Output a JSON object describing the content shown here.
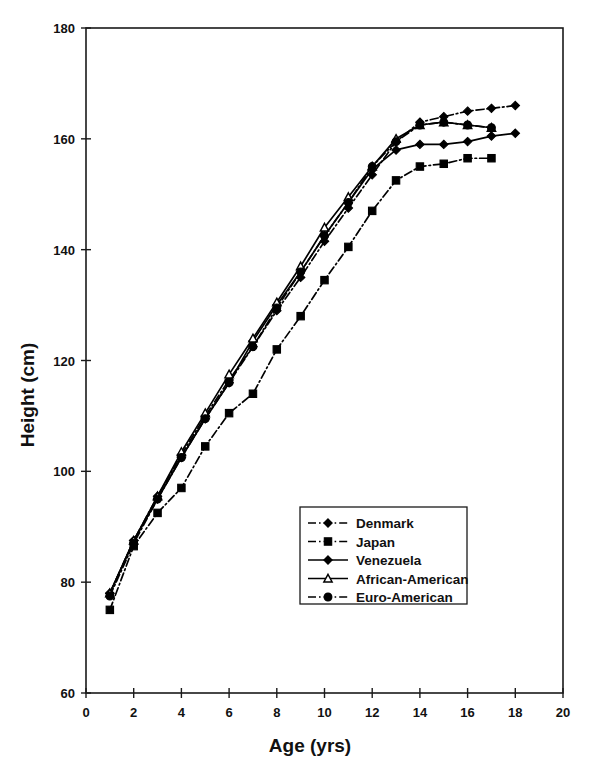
{
  "chart_data": {
    "type": "line",
    "title": "",
    "xlabel": "Age (yrs)",
    "ylabel": "Height (cm)",
    "xlim": [
      0,
      20
    ],
    "ylim": [
      60,
      180
    ],
    "xticks": [
      0,
      2,
      4,
      6,
      8,
      10,
      12,
      14,
      16,
      18,
      20
    ],
    "yticks": [
      60,
      80,
      100,
      120,
      140,
      160,
      180
    ],
    "xtick_labels": [
      "0",
      "2",
      "4",
      "6",
      "8",
      "10",
      "12",
      "14",
      "16",
      "18",
      "20"
    ],
    "ytick_labels": [
      "60",
      "80",
      "100",
      "120",
      "140",
      "160",
      "180"
    ],
    "grid": false,
    "legend_position": "center-bottom-inside",
    "series": [
      {
        "name": "Denmark",
        "marker": "diamond",
        "marker_fill": "solid",
        "line_style": "dash-dot",
        "x": [
          1,
          2,
          3,
          4,
          5,
          6,
          7,
          8,
          9,
          10,
          11,
          12,
          13,
          14,
          15,
          16,
          17,
          18
        ],
        "y": [
          78.0,
          87.5,
          95.5,
          103.0,
          110.0,
          116.5,
          122.5,
          129.0,
          135.0,
          141.5,
          147.5,
          153.5,
          159.5,
          163.0,
          164.0,
          165.0,
          165.5,
          166.0
        ]
      },
      {
        "name": "Japan",
        "marker": "square",
        "marker_fill": "solid",
        "line_style": "dash-dot",
        "x": [
          1,
          2,
          3,
          4,
          5,
          6,
          7,
          8,
          9,
          10,
          11,
          12,
          13,
          14,
          15,
          16,
          17
        ],
        "y": [
          75.0,
          86.5,
          92.5,
          97.0,
          104.5,
          110.5,
          114.0,
          122.0,
          128.0,
          134.5,
          140.5,
          147.0,
          152.5,
          155.0,
          155.5,
          156.5,
          156.5
        ]
      },
      {
        "name": "Venezuela",
        "marker": "diamond",
        "marker_fill": "solid",
        "line_style": "solid",
        "x": [
          1,
          2,
          3,
          4,
          5,
          6,
          7,
          8,
          9,
          10,
          11,
          12,
          13,
          14,
          15,
          16,
          17,
          18
        ],
        "y": [
          78.0,
          87.5,
          95.0,
          102.5,
          109.5,
          116.0,
          123.5,
          130.0,
          136.0,
          142.5,
          148.5,
          154.5,
          158.0,
          159.0,
          159.0,
          159.5,
          160.5,
          161.0
        ]
      },
      {
        "name": "African-American",
        "marker": "triangle",
        "marker_fill": "open",
        "line_style": "solid",
        "x": [
          1,
          2,
          3,
          4,
          5,
          6,
          7,
          8,
          9,
          10,
          11,
          12,
          13,
          14,
          15,
          16,
          17
        ],
        "y": [
          78.0,
          87.5,
          95.5,
          103.5,
          110.5,
          117.5,
          124.0,
          130.5,
          137.0,
          144.0,
          149.5,
          155.0,
          160.0,
          162.5,
          163.0,
          162.5,
          162.0
        ]
      },
      {
        "name": "Euro-American",
        "marker": "circle",
        "marker_fill": "solid",
        "line_style": "dash-dot",
        "x": [
          1,
          2,
          3,
          4,
          5,
          6,
          7,
          8,
          9,
          10,
          11,
          12,
          13,
          14,
          15,
          16,
          17
        ],
        "y": [
          77.5,
          87.0,
          95.0,
          102.5,
          109.5,
          116.0,
          122.5,
          129.5,
          136.0,
          142.5,
          148.5,
          155.0,
          159.5,
          162.5,
          163.0,
          162.5,
          162.0
        ]
      }
    ]
  },
  "axes": {
    "y_title": "Height (cm)",
    "x_title": "Age (yrs)"
  },
  "legend": {
    "items": [
      {
        "label": "Denmark",
        "marker": "diamond",
        "style": "dash-dot"
      },
      {
        "label": "Japan",
        "marker": "square",
        "style": "dash-dot"
      },
      {
        "label": "Venezuela",
        "marker": "diamond",
        "style": "solid"
      },
      {
        "label": "African-American",
        "marker": "triangle",
        "style": "solid"
      },
      {
        "label": "Euro-American",
        "marker": "circle",
        "style": "dash-dot"
      }
    ]
  }
}
